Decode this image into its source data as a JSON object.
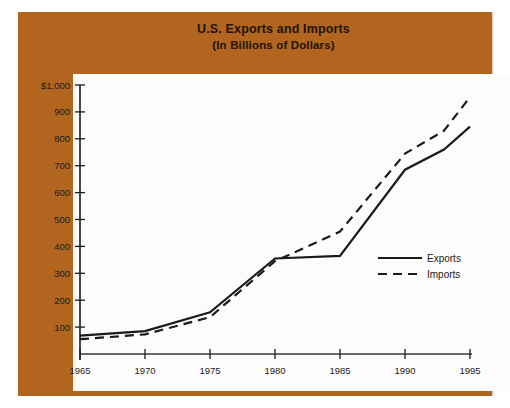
{
  "figure": {
    "title_line1": "U.S. Exports and Imports",
    "title_line2": "(In Billions of Dollars)",
    "frame_color": "#b1651f",
    "plot_background": "#fdfcfa",
    "line_color": "#1b1b1b"
  },
  "axes": {
    "y_ticks": [
      "$1,000",
      "900",
      "800",
      "700",
      "600",
      "500",
      "400",
      "300",
      "200",
      "100"
    ],
    "x_ticks": [
      "1965",
      "1970",
      "1975",
      "1980",
      "1985",
      "1990",
      "1995"
    ]
  },
  "legend": {
    "entries": [
      {
        "label": "Exports",
        "style": "solid"
      },
      {
        "label": "Imports",
        "style": "dashed"
      }
    ]
  },
  "chart_data": {
    "type": "line",
    "title": "U.S. Exports and Imports",
    "subtitle": "(In Billions of Dollars)",
    "xlabel": "",
    "ylabel": "",
    "xlim": [
      1965,
      1995
    ],
    "ylim": [
      0,
      1000
    ],
    "ytick_values": [
      100,
      200,
      300,
      400,
      500,
      600,
      700,
      800,
      900,
      1000
    ],
    "xtick_values": [
      1965,
      1970,
      1975,
      1980,
      1985,
      1990,
      1995
    ],
    "grid": false,
    "legend_position": "right-middle",
    "x": [
      1965,
      1970,
      1975,
      1980,
      1985,
      1990,
      1993,
      1995
    ],
    "series": [
      {
        "name": "Exports",
        "style": "solid",
        "values": [
          68,
          85,
          155,
          355,
          365,
          685,
          760,
          845
        ]
      },
      {
        "name": "Imports",
        "style": "dashed",
        "values": [
          55,
          73,
          137,
          345,
          455,
          745,
          830,
          955
        ]
      }
    ]
  }
}
